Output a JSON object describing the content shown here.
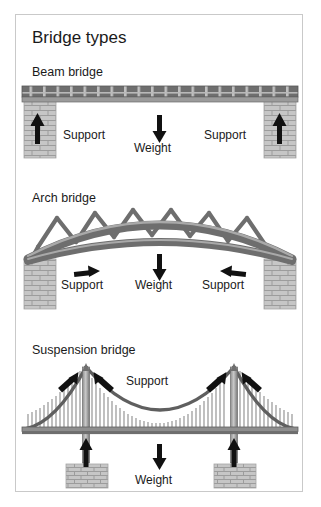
{
  "poster": {
    "title": "Bridge types",
    "border_color": "#c9c9c9",
    "background": "#ffffff"
  },
  "palette": {
    "deck_dark": "#6e6e6e",
    "deck_mid": "#8a8a8a",
    "brick_light": "#c6c6c6",
    "brick_line": "#9a9a9a",
    "arrow_black": "#111111",
    "cable_gray": "#707070",
    "text": "#1a1a1a"
  },
  "sections": [
    {
      "id": "beam",
      "heading": "Beam bridge",
      "labels": {
        "support_left": "Support",
        "weight": "Weight",
        "support_right": "Support"
      },
      "arrows": {
        "support_left_dir": "up",
        "support_right_dir": "up",
        "weight_dir": "down"
      }
    },
    {
      "id": "arch",
      "heading": "Arch bridge",
      "labels": {
        "support_left": "Support",
        "weight": "Weight",
        "support_right": "Support"
      },
      "arrows": {
        "support_left_dir": "right",
        "support_right_dir": "left",
        "weight_dir": "down"
      }
    },
    {
      "id": "suspension",
      "heading": "Suspension bridge",
      "labels": {
        "support": "Support",
        "weight": "Weight"
      },
      "arrows": {
        "tower_left_outer_dir": "up-right",
        "tower_left_inner_dir": "up-left",
        "tower_right_outer_dir": "up-right",
        "tower_right_inner_dir": "up-left",
        "pier_left_dir": "up",
        "pier_right_dir": "up",
        "weight_dir": "down"
      }
    }
  ]
}
